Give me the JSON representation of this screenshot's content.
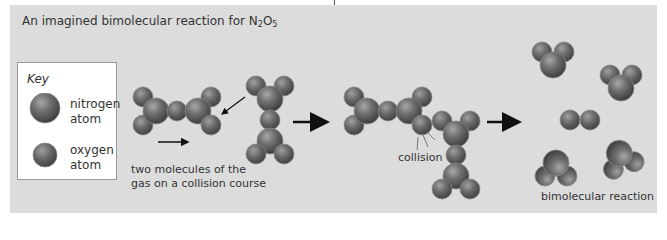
{
  "title": {
    "prefix": "An imagined bimolecular reaction for N",
    "sub1": "2",
    "mid": "O",
    "sub2": "5"
  },
  "key": {
    "heading": "Key",
    "items": [
      {
        "label_line1": "nitrogen",
        "label_line2": "atom",
        "icon": "large-sphere"
      },
      {
        "label_line1": "oxygen",
        "label_line2": "atom",
        "icon": "small-sphere"
      }
    ]
  },
  "stages": [
    {
      "caption_line1": "two molecules of the",
      "caption_line2": "gas on a collision course"
    },
    {
      "caption_line1": "collision"
    },
    {
      "caption_line1": "bimolecular reaction"
    }
  ],
  "colors": {
    "panel_bg": "#dcdcdc",
    "atom_dark": "#4a4a4a",
    "atom_mid": "#7a7a7a",
    "atom_light": "#b0b0b0",
    "arrow": "#111111"
  }
}
